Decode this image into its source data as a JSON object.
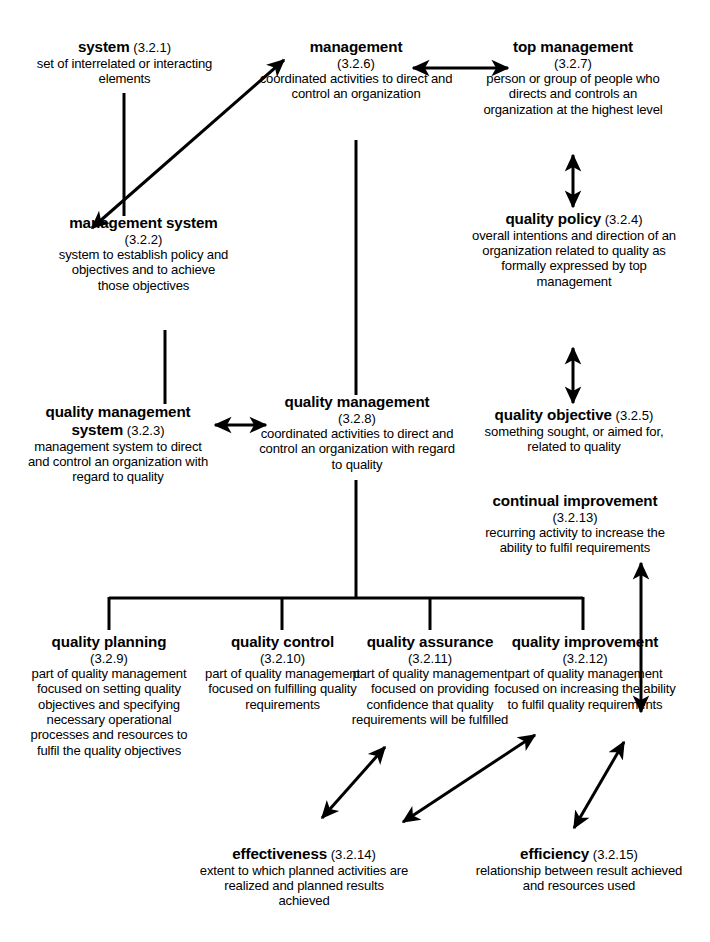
{
  "diagram": {
    "ink_color": "#000000",
    "background_color": "#ffffff",
    "nodes": [
      {
        "id": "system",
        "term": "system",
        "ref": "(3.2.1)",
        "ref_inline": true,
        "definition": "set of interrelated or interacting elements"
      },
      {
        "id": "management",
        "term": "management",
        "ref": "(3.2.6)",
        "ref_inline": false,
        "definition": "coordinated activities to direct and control an organization"
      },
      {
        "id": "top-management",
        "term": "top management",
        "ref": "(3.2.7)",
        "ref_inline": false,
        "definition": "person or group of people who directs and controls an organization at the highest level"
      },
      {
        "id": "management-system",
        "term": "management system",
        "ref": "(3.2.2)",
        "ref_inline": true,
        "definition": "system to establish policy and objectives and to achieve those objectives"
      },
      {
        "id": "quality-policy",
        "term": "quality policy",
        "ref": "(3.2.4)",
        "ref_inline": true,
        "definition": "overall intentions and direction of an organization related to quality as formally expressed by top management"
      },
      {
        "id": "quality-management-system",
        "term": "quality management system",
        "ref": "(3.2.3)",
        "ref_inline": true,
        "definition": "management system to direct and control an organization with regard to quality"
      },
      {
        "id": "quality-management",
        "term": "quality management",
        "ref": "(3.2.8)",
        "ref_inline": false,
        "definition": "coordinated activities to direct and control an organization with regard to quality"
      },
      {
        "id": "quality-objective",
        "term": "quality objective",
        "ref": "(3.2.5)",
        "ref_inline": true,
        "definition": "something sought, or aimed for, related to quality"
      },
      {
        "id": "continual-improvement",
        "term": "continual improvement",
        "ref": "(3.2.13)",
        "ref_inline": false,
        "definition": "recurring activity to increase the ability to fulfil requirements"
      },
      {
        "id": "quality-planning",
        "term": "quality planning",
        "ref": "(3.2.9)",
        "ref_inline": false,
        "definition": "part of quality management focused on setting quality objectives and specifying necessary operational processes and resources to fulfil the quality objectives"
      },
      {
        "id": "quality-control",
        "term": "quality control",
        "ref": "(3.2.10)",
        "ref_inline": false,
        "definition": "part of quality management focused on fulfilling quality requirements"
      },
      {
        "id": "quality-assurance",
        "term": "quality assurance",
        "ref": "(3.2.11)",
        "ref_inline": false,
        "definition": "part of quality management focused on providing confidence that quality requirements will be fulfilled"
      },
      {
        "id": "quality-improvement",
        "term": "quality improvement",
        "ref": "(3.2.12)",
        "ref_inline": false,
        "definition": "part of quality management focused on increasing the ability to fulfil quality requirements"
      },
      {
        "id": "effectiveness",
        "term": "effectiveness",
        "ref": "(3.2.14)",
        "ref_inline": true,
        "definition": "extent to which planned activities are realized and planned results achieved"
      },
      {
        "id": "efficiency",
        "term": "efficiency",
        "ref": "(3.2.15)",
        "ref_inline": true,
        "definition": "relationship between result achieved and resources used"
      }
    ],
    "connectors": [
      {
        "from": "system",
        "to": "management-system",
        "style": "plain-line"
      },
      {
        "from": "management-system",
        "to": "management",
        "style": "double-arrow-diagonal"
      },
      {
        "from": "management",
        "to": "top-management",
        "style": "double-arrow-horizontal"
      },
      {
        "from": "top-management",
        "to": "quality-policy",
        "style": "double-arrow-vertical"
      },
      {
        "from": "quality-policy",
        "to": "quality-objective",
        "style": "double-arrow-vertical"
      },
      {
        "from": "management-system",
        "to": "quality-management-system",
        "style": "plain-line"
      },
      {
        "from": "quality-management-system",
        "to": "quality-management",
        "style": "double-arrow-horizontal"
      },
      {
        "from": "management",
        "to": "quality-management",
        "style": "plain-line"
      },
      {
        "from": "quality-management",
        "to": "quality-planning",
        "style": "bus-branch"
      },
      {
        "from": "quality-management",
        "to": "quality-control",
        "style": "bus-branch"
      },
      {
        "from": "quality-management",
        "to": "quality-assurance",
        "style": "bus-branch"
      },
      {
        "from": "quality-management",
        "to": "quality-improvement",
        "style": "bus-branch"
      },
      {
        "from": "continual-improvement",
        "to": "quality-improvement",
        "style": "double-arrow-vertical"
      },
      {
        "from": "quality-assurance",
        "to": "effectiveness",
        "style": "double-arrow-diagonal"
      },
      {
        "from": "quality-improvement",
        "to": "effectiveness",
        "style": "double-arrow-diagonal"
      },
      {
        "from": "quality-improvement",
        "to": "efficiency",
        "style": "double-arrow-diagonal"
      }
    ]
  }
}
